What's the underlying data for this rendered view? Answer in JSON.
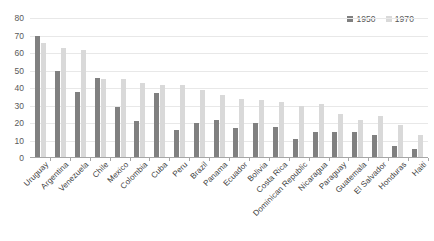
{
  "chart_data": {
    "type": "bar",
    "title": "",
    "subtitle": "",
    "xlabel": "",
    "ylabel": "",
    "ylim": [
      0,
      80
    ],
    "yticks": [
      0,
      10,
      20,
      30,
      40,
      50,
      60,
      70,
      80
    ],
    "ytick_labels": [
      "0",
      "10",
      "20",
      "30",
      "40",
      "50",
      "60",
      "70",
      "80"
    ],
    "grid": true,
    "legend_position": "top-right",
    "categories": [
      "Uruguay",
      "Argentina",
      "Venezuela",
      "Chile",
      "Mexico",
      "Colombia",
      "Cuba",
      "Peru",
      "Brazil",
      "Panama",
      "Ecuador",
      "Bolivia",
      "Costa Rica",
      "Dominican Republic",
      "Nicaragua",
      "Paraguay",
      "Guatemala",
      "El Salvador",
      "Honduras",
      "Haiti"
    ],
    "series": [
      {
        "name": "1950",
        "color": "#808080",
        "values": [
          70,
          50,
          38,
          46,
          29,
          21,
          37,
          16,
          20,
          22,
          17,
          20,
          18,
          11,
          15,
          15,
          15,
          13,
          7,
          5
        ]
      },
      {
        "name": "1970",
        "color": "#d9d9d9",
        "values": [
          66,
          63,
          62,
          45,
          45,
          43,
          42,
          42,
          39,
          36,
          34,
          33,
          32,
          30,
          31,
          25,
          22,
          24,
          19,
          13
        ]
      }
    ]
  },
  "colors": {
    "series_1950": "#808080",
    "series_1970": "#d9d9d9",
    "gridline": "#e8e8e8",
    "axis": "#a6a6a6",
    "tick_text": "#595959",
    "label_text": "#404040",
    "background": "#ffffff"
  }
}
